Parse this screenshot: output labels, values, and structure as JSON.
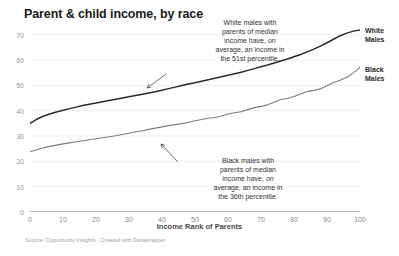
{
  "chart_data": {
    "type": "line",
    "title": "Parent & child income, by race",
    "xlabel": "Income Rank of Parents",
    "ylabel": "",
    "xlim": [
      0,
      100
    ],
    "ylim": [
      0,
      75
    ],
    "grid": true,
    "legend_position": "right-of-line-end",
    "x_ticks": [
      0,
      10,
      20,
      30,
      40,
      50,
      60,
      70,
      80,
      90,
      100
    ],
    "y_ticks": [
      0,
      10,
      20,
      30,
      40,
      50,
      60,
      70
    ],
    "x": [
      0,
      2,
      4,
      6,
      8,
      10,
      12,
      14,
      16,
      18,
      20,
      22,
      24,
      26,
      28,
      30,
      32,
      34,
      36,
      38,
      40,
      42,
      44,
      46,
      48,
      50,
      52,
      54,
      56,
      58,
      60,
      62,
      64,
      66,
      68,
      70,
      72,
      74,
      76,
      78,
      80,
      82,
      84,
      86,
      88,
      90,
      92,
      94,
      96,
      98,
      100
    ],
    "series": [
      {
        "name": "White Males",
        "color": "#2b2b2b",
        "values": [
          35.0,
          36.6,
          37.8,
          38.7,
          39.5,
          40.2,
          40.8,
          41.4,
          42.0,
          42.5,
          43.0,
          43.5,
          44.0,
          44.5,
          45.0,
          45.5,
          46.0,
          46.5,
          47.0,
          47.5,
          48.1,
          48.7,
          49.3,
          49.9,
          50.5,
          51.0,
          51.6,
          52.2,
          52.8,
          53.4,
          54.0,
          54.6,
          55.2,
          55.9,
          56.6,
          57.3,
          58.0,
          58.8,
          59.6,
          60.4,
          61.3,
          62.2,
          63.2,
          64.3,
          65.5,
          66.8,
          68.2,
          69.6,
          70.6,
          71.4,
          71.8
        ]
      },
      {
        "name": "Black Males",
        "color": "#7d7d7d",
        "values": [
          23.8,
          24.6,
          25.3,
          25.9,
          26.4,
          26.9,
          27.3,
          27.7,
          28.1,
          28.5,
          28.9,
          29.3,
          29.7,
          30.1,
          30.6,
          31.1,
          31.6,
          32.1,
          32.6,
          33.1,
          33.6,
          34.1,
          34.5,
          34.9,
          35.4,
          36.0,
          36.5,
          37.0,
          37.3,
          37.9,
          38.7,
          39.2,
          39.6,
          40.4,
          41.2,
          41.7,
          42.3,
          43.3,
          44.4,
          44.8,
          45.6,
          46.6,
          47.6,
          48.0,
          48.6,
          49.8,
          51.1,
          52.0,
          53.2,
          55.0,
          57.0
        ]
      }
    ],
    "annotations": [
      {
        "id": "white-annotation",
        "lines": [
          "White males with",
          "parents of median",
          "income have, on",
          "average, an income in",
          "the 51st percentile."
        ],
        "points_to_series": "White Males",
        "points_to_x": 40,
        "points_to_y": 48
      },
      {
        "id": "black-annotation",
        "lines": [
          "Black males with",
          "parents of median",
          "income have, on",
          "average, an income in",
          "the 36th percentile."
        ],
        "points_to_series": "Black Males",
        "points_to_x": 47,
        "points_to_y": 35
      }
    ]
  },
  "source": {
    "text": "Source: Opportunity Insights · Created with Datawrapper"
  },
  "labels": {
    "white_line_1": "White",
    "white_line_2": "Males",
    "black_line_1": "Black",
    "black_line_2": "Males"
  },
  "annotation_white": {
    "l1": "White males with",
    "l2": "parents of median",
    "l3": "income have, on",
    "l4": "average, an income in",
    "l5": "the 51st percentile."
  },
  "annotation_black": {
    "l1": "Black males with",
    "l2": "parents of median",
    "l3": "income have, on",
    "l4": "average, an income in",
    "l5": "the 36th percentile."
  }
}
